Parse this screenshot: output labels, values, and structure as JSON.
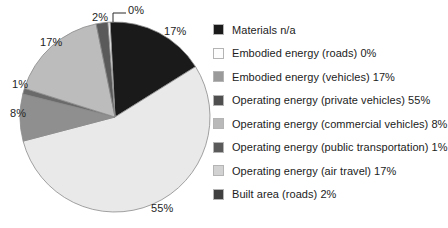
{
  "chart_data": {
    "type": "pie",
    "title": "",
    "legend_position": "right",
    "categories": [
      "Materials n/a",
      "Embodied energy (roads)",
      "Embodied energy (vehicles)",
      "Operating energy (private vehicles)",
      "Operating energy (commercial vehicles)",
      "Operating energy (public transportation)",
      "Operating energy (air travel)",
      "Built area (roads)"
    ],
    "values": [
      17,
      0,
      17,
      55,
      8,
      1,
      17,
      2
    ],
    "value_unit": "%",
    "slice_labels": [
      "17%",
      "0%",
      "17%",
      "55%",
      "8%",
      "1%",
      "17%",
      "2%"
    ],
    "colors": [
      "#1a1a1a",
      "#fdfdfd",
      "#9a9a9a",
      "#e9e9e9",
      "#8f8f8f",
      "#6a6a6a",
      "#bcbcbc",
      "#5a5a5a"
    ]
  },
  "pie": {
    "center_x": 115,
    "center_y": 117,
    "radius": 95,
    "start_angle_deg": -3,
    "outline_color": "#8a8a8a",
    "slices": [
      {
        "name": "materials",
        "label": "17%",
        "value": 17,
        "color": "#1a1a1a"
      },
      {
        "name": "operating-energy-private-vehicles",
        "label": "55%",
        "value": 55,
        "color": "#e9e9e9"
      },
      {
        "name": "operating-energy-commercial-vehicles",
        "label": "8%",
        "value": 8,
        "color": "#8f8f8f"
      },
      {
        "name": "operating-energy-public-transportation",
        "label": "1%",
        "value": 1,
        "color": "#6a6a6a"
      },
      {
        "name": "operating-energy-air-travel",
        "label": "17%",
        "value": 17,
        "color": "#bcbcbc"
      },
      {
        "name": "built-area-roads",
        "label": "2%",
        "value": 2,
        "color": "#5a5a5a"
      },
      {
        "name": "embodied-energy-roads",
        "label": "0%",
        "value": 0.35,
        "color": "#fdfdfd"
      }
    ],
    "labels": {
      "materials": "17%",
      "private_vehicles": "55%",
      "commercial_vehicles": "8%",
      "public_transportation": "1%",
      "air_travel": "17%",
      "built_area": "2%",
      "embodied_roads": "0%"
    }
  },
  "legend": {
    "items": [
      {
        "label": "Materials n/a",
        "color": "#1a1a1a"
      },
      {
        "label": "Embodied energy (roads) 0%",
        "color": "#fdfdfd"
      },
      {
        "label": "Embodied energy (vehicles) 17%",
        "color": "#9a9a9a"
      },
      {
        "label": "Operating energy (private vehicles) 55%",
        "color": "#4f4f4f"
      },
      {
        "label": "Operating energy (commercial vehicles) 8%",
        "color": "#b9b9b9"
      },
      {
        "label": "Operating energy (public transportation) 1%",
        "color": "#5a5a5a"
      },
      {
        "label": "Operating energy (air travel) 17%",
        "color": "#d2d2d2"
      },
      {
        "label": "Built area (roads) 2%",
        "color": "#3f3f3f"
      }
    ]
  }
}
